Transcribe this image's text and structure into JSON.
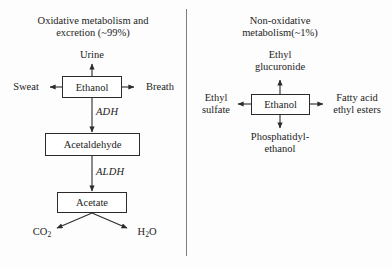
{
  "figure": {
    "background_color": "#fdfdfd",
    "line_color": "#2b2b2b",
    "divider_color": "#7d7d7d"
  },
  "left_panel": {
    "title_line1": "Oxidative metabolism and",
    "title_line2": "excretion (~99%)",
    "nodes": {
      "urine": "Urine",
      "sweat": "Sweat",
      "breath": "Breath",
      "ethanol": "Ethanol",
      "acetaldehyde": "Acetaldehyde",
      "acetate": "Acetate",
      "co2_main": "CO",
      "co2_sub": "2",
      "h2o_h": "H",
      "h2o_sub": "2",
      "h2o_o": "O"
    },
    "enzymes": {
      "adh": "ADH",
      "aldh": "ALDH"
    }
  },
  "right_panel": {
    "title_line1": "Non-oxidative",
    "title_line2": "metabolism(~1%)",
    "nodes": {
      "ethyl_glucuronide_l1": "Ethyl",
      "ethyl_glucuronide_l2": "glucuronide",
      "ethyl_sulfate_l1": "Ethyl",
      "ethyl_sulfate_l2": "sulfate",
      "ethanol": "Ethanol",
      "fatty_acid_l1": "Fatty acid",
      "fatty_acid_l2": "ethyl esters",
      "phosphatidyl_l1": "Phosphatidyl-",
      "phosphatidyl_l2": "ethanol"
    }
  }
}
